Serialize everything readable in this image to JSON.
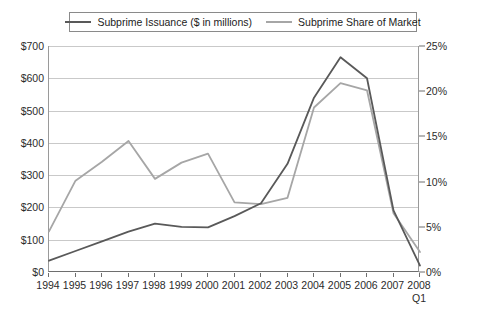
{
  "legend": {
    "entries": [
      {
        "label": "Subprime Issuance ($ in millions)",
        "color": "#595959",
        "name": "issuance"
      },
      {
        "label": "Subprime Share of Market",
        "color": "#a6a6a6",
        "name": "share"
      }
    ]
  },
  "axes": {
    "left_ticks": [
      "$0",
      "$100",
      "$200",
      "$300",
      "$400",
      "$500",
      "$600",
      "$700"
    ],
    "right_ticks": [
      "0%",
      "5%",
      "10%",
      "15%",
      "20%",
      "25%"
    ],
    "x_sublabel": "Q1"
  },
  "chart_data": {
    "type": "line",
    "title": "",
    "xlabel": "",
    "ylabel": "",
    "grid": true,
    "legend_position": "top",
    "categories": [
      "1994",
      "1995",
      "1996",
      "1997",
      "1998",
      "1999",
      "2000",
      "2001",
      "2002",
      "2003",
      "2004",
      "2005",
      "2006",
      "2007",
      "2008"
    ],
    "x_last_note": "Q1",
    "series": [
      {
        "name": "Subprime Issuance ($ in millions)",
        "color": "#595959",
        "axis": "left",
        "unit": "$ millions",
        "ylim": [
          0,
          700
        ],
        "values": [
          35,
          65,
          95,
          125,
          150,
          140,
          138,
          173,
          213,
          335,
          540,
          665,
          600,
          191,
          20
        ]
      },
      {
        "name": "Subprime Share of Market",
        "color": "#a6a6a6",
        "axis": "right",
        "unit": "percent",
        "ylim": [
          0,
          25
        ],
        "values": [
          4.5,
          10.1,
          12.2,
          14.5,
          10.3,
          12.1,
          13.1,
          7.7,
          7.5,
          8.2,
          18.2,
          20.9,
          20.1,
          6.5,
          2.2
        ]
      }
    ]
  }
}
